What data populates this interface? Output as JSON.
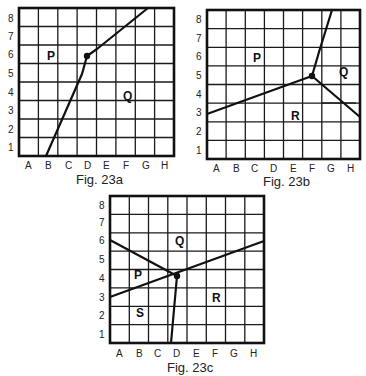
{
  "figures": [
    {
      "id": "fig-23a",
      "caption": "Fig. 23a",
      "x_labels": [
        "A",
        "B",
        "C",
        "D",
        "E",
        "F",
        "G",
        "H"
      ],
      "y_labels": [
        "1",
        "2",
        "3",
        "4",
        "5",
        "6",
        "7",
        "8"
      ],
      "regions": [
        {
          "label": "P",
          "cell": "B6"
        },
        {
          "label": "Q",
          "cell": "F4"
        }
      ],
      "point": {
        "near": "D6"
      },
      "boundaries": [
        "from bottom edge at B through point near D6, bending near E6.5, to top edge near G/H 8"
      ]
    },
    {
      "id": "fig-23b",
      "caption": "Fig. 23b",
      "x_labels": [
        "A",
        "B",
        "C",
        "D",
        "E",
        "F",
        "G",
        "H"
      ],
      "y_labels": [
        "1",
        "2",
        "3",
        "4",
        "5",
        "6",
        "7",
        "8"
      ],
      "regions": [
        {
          "label": "P",
          "cell": "C6"
        },
        {
          "label": "Q",
          "cell": "H5"
        },
        {
          "label": "R",
          "cell": "E3"
        }
      ],
      "point": {
        "near": "F5"
      },
      "boundaries": [
        "from left edge at 3 to point near F5",
        "from point up to top edge near G8",
        "from point down-right to right edge near 2.7"
      ]
    },
    {
      "id": "fig-23c",
      "caption": "Fig. 23c",
      "x_labels": [
        "A",
        "B",
        "C",
        "D",
        "E",
        "F",
        "G",
        "H"
      ],
      "y_labels": [
        "1",
        "2",
        "3",
        "4",
        "5",
        "6",
        "7",
        "8"
      ],
      "regions": [
        {
          "label": "P",
          "cell": "B4"
        },
        {
          "label": "Q",
          "cell": "D6"
        },
        {
          "label": "R",
          "cell": "F3"
        },
        {
          "label": "S",
          "cell": "B2"
        }
      ],
      "point": {
        "near": "D4"
      },
      "boundaries": [
        "from left edge at 6 to point near D4",
        "straight line from left edge at 3 to right edge at 6",
        "from point down to bottom edge at D"
      ]
    }
  ]
}
